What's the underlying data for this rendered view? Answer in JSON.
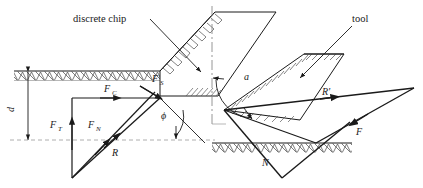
{
  "figure": {
    "name": "orthogonal-cutting-force-diagram",
    "width": 423,
    "height": 188,
    "background": "#ffffff",
    "line_color": "#1a1a1a",
    "hatch_color": "#555555",
    "dash_color": "#888888"
  },
  "callouts": {
    "chip": "discrete chip",
    "tool": "tool"
  },
  "labels": {
    "depth": "d",
    "cutting_force": "F",
    "cutting_force_sub": "C",
    "shear_force": "F",
    "shear_force_sub": "S",
    "thrust_force": "F",
    "thrust_force_sub": "T",
    "normal_force": "F",
    "normal_force_sub": "N",
    "resultant": "R",
    "resultant_prime": "R'",
    "friction_force": "F",
    "normal_tool_force": "N",
    "shear_angle": "ϕ",
    "rake_angle": "a"
  }
}
